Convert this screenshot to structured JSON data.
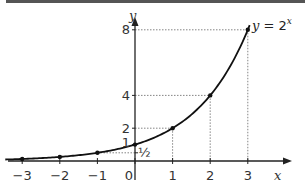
{
  "chart_data": {
    "type": "line",
    "title": "",
    "function_label": "y = 2",
    "function_exponent": "x",
    "xlabel": "x",
    "ylabel": "y",
    "xlim": [
      -3.5,
      3.6
    ],
    "ylim": [
      0,
      8.5
    ],
    "grid": false,
    "x_tick_labels": [
      "−3",
      "−2",
      "−1",
      "0",
      "1",
      "2",
      "3"
    ],
    "y_tick_labels": [
      "1",
      "2",
      "4",
      "8"
    ],
    "half_label": "½",
    "series": [
      {
        "name": "y = 2^x",
        "x": [
          -3,
          -2,
          -1,
          0,
          1,
          2,
          3
        ],
        "y": [
          0.125,
          0.25,
          0.5,
          1,
          2,
          4,
          8
        ]
      }
    ],
    "guide_lines": "dotted lines from marked points to both axes"
  }
}
